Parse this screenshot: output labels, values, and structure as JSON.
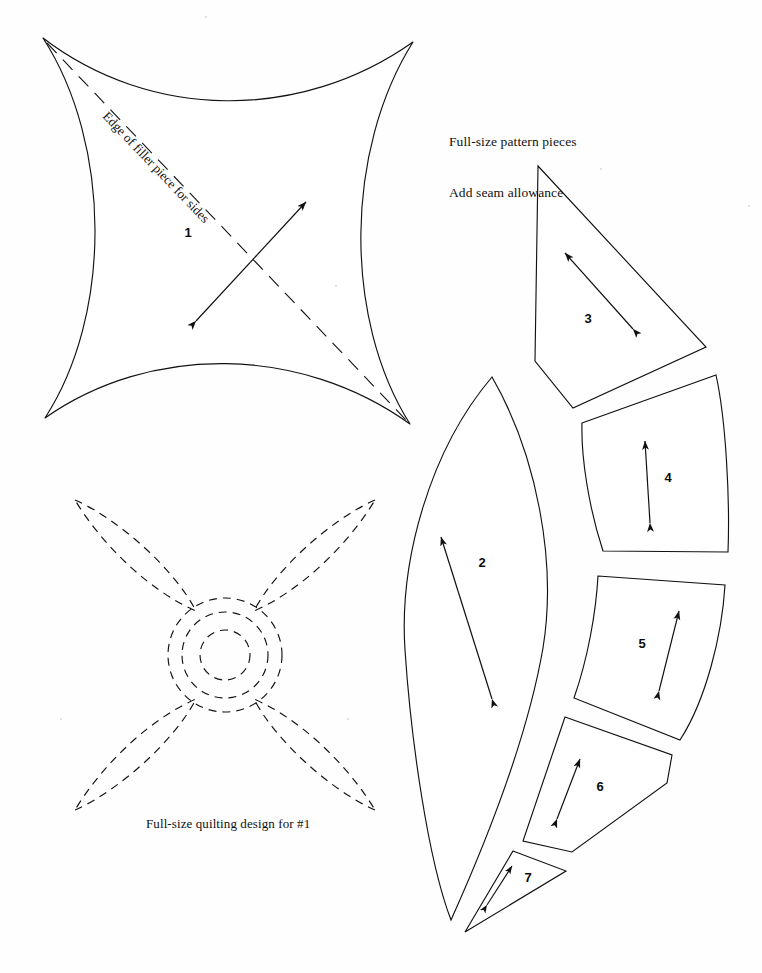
{
  "document": {
    "kind": "quilt-pattern-sheet",
    "background_color": "#ffffff",
    "ink_color": "#111111",
    "width": 762,
    "height": 973
  },
  "notes": {
    "pattern_note_line1": "Full-size pattern pieces",
    "pattern_note_line2": "Add seam allowance",
    "quilting_note": "Full-size quilting design for #1"
  },
  "labels": {
    "filler_edge": "Edge of filler piece for sides"
  },
  "pieces": [
    {
      "number": "1",
      "label_x": 188,
      "label_y": 232,
      "shape": "concave-sided square"
    },
    {
      "number": "2",
      "label_x": 482,
      "label_y": 562,
      "shape": "lens / leaf"
    },
    {
      "number": "3",
      "label_x": 588,
      "label_y": 318,
      "shape": "quadrilateral wedge"
    },
    {
      "number": "4",
      "label_x": 668,
      "label_y": 477,
      "shape": "curved quadrilateral"
    },
    {
      "number": "5",
      "label_x": 642,
      "label_y": 643,
      "shape": "curved quadrilateral"
    },
    {
      "number": "6",
      "label_x": 600,
      "label_y": 786,
      "shape": "pentagon wedge"
    },
    {
      "number": "7",
      "label_x": 528,
      "label_y": 877,
      "shape": "small triangle"
    }
  ],
  "grainline_arrows": [
    {
      "piece": "1",
      "x1": 196,
      "y1": 321,
      "x2": 306,
      "y2": 202,
      "double_headed": true
    },
    {
      "piece": "2",
      "x1": 492,
      "y1": 699,
      "x2": 441,
      "y2": 537,
      "double_headed": true
    },
    {
      "piece": "3",
      "x1": 633,
      "y1": 329,
      "x2": 565,
      "y2": 253,
      "double_headed": true
    },
    {
      "piece": "4",
      "x1": 650,
      "y1": 523,
      "x2": 645,
      "y2": 441,
      "double_headed": true
    },
    {
      "piece": "5",
      "x1": 659,
      "y1": 691,
      "x2": 679,
      "y2": 611,
      "double_headed": true
    },
    {
      "piece": "6",
      "x1": 557,
      "y1": 819,
      "x2": 580,
      "y2": 759,
      "double_headed": true
    },
    {
      "piece": "7",
      "x1": 487,
      "y1": 905,
      "x2": 512,
      "y2": 866,
      "double_headed": true
    }
  ],
  "quilting_design": {
    "center_x": 225,
    "center_y": 655,
    "petal_count": 4,
    "circle_radii": [
      57,
      43,
      25
    ],
    "line_style": "dashed",
    "corners": [
      [
        75,
        500
      ],
      [
        375,
        500
      ],
      [
        375,
        810
      ],
      [
        75,
        810
      ]
    ]
  }
}
